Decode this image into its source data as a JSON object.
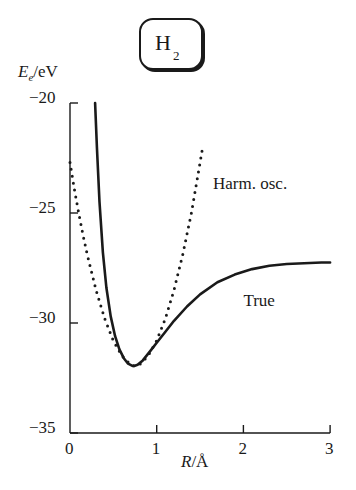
{
  "chart_data": {
    "type": "line",
    "title_main": "H",
    "title_subscript": "2",
    "xlabel": "R/Å",
    "xlabel_var": "R",
    "xlabel_unit": "/Å",
    "ylabel": "Ee/eV",
    "ylabel_var": "E",
    "ylabel_sub": "e",
    "ylabel_unit": "/eV",
    "xlim": [
      0,
      3
    ],
    "ylim": [
      -35,
      -20
    ],
    "xticks": [
      0,
      1,
      2,
      3
    ],
    "xtick_labels": [
      "0",
      "1",
      "2",
      "3"
    ],
    "yticks": [
      -20,
      -25,
      -30,
      -35
    ],
    "ytick_labels": [
      "−20",
      "−25",
      "−30",
      "−35"
    ],
    "grid": false,
    "series": [
      {
        "name": "True",
        "style": "solid",
        "x": [
          0.29,
          0.31,
          0.34,
          0.38,
          0.42,
          0.47,
          0.52,
          0.57,
          0.62,
          0.67,
          0.72,
          0.74,
          0.78,
          0.84,
          0.92,
          1.0,
          1.1,
          1.2,
          1.35,
          1.5,
          1.7,
          1.9,
          2.1,
          2.3,
          2.5,
          2.7,
          2.9,
          3.0
        ],
        "y": [
          -20.0,
          -22.0,
          -24.5,
          -26.8,
          -28.4,
          -29.7,
          -30.6,
          -31.2,
          -31.6,
          -31.85,
          -31.95,
          -31.95,
          -31.9,
          -31.7,
          -31.3,
          -30.9,
          -30.4,
          -29.9,
          -29.25,
          -28.7,
          -28.15,
          -27.8,
          -27.55,
          -27.4,
          -27.32,
          -27.28,
          -27.25,
          -27.25
        ]
      },
      {
        "name": "Harm. osc.",
        "style": "dotted",
        "x": [
          0.0,
          0.05,
          0.1,
          0.15,
          0.2,
          0.3,
          0.4,
          0.5,
          0.6,
          0.7,
          0.74,
          0.8,
          0.9,
          1.0,
          1.1,
          1.2,
          1.3,
          1.4,
          1.5,
          1.53
        ],
        "y": [
          -22.7,
          -23.9,
          -25.0,
          -26.0,
          -26.9,
          -28.5,
          -29.8,
          -30.8,
          -31.5,
          -31.9,
          -31.95,
          -31.9,
          -31.5,
          -30.8,
          -29.8,
          -28.5,
          -26.9,
          -25.0,
          -22.7,
          -22.0
        ]
      }
    ],
    "annotations": [
      {
        "text": "Harm. osc.",
        "x": 1.65,
        "y": -23.7
      },
      {
        "text": "True",
        "x": 2.0,
        "y": -29.0
      }
    ]
  }
}
